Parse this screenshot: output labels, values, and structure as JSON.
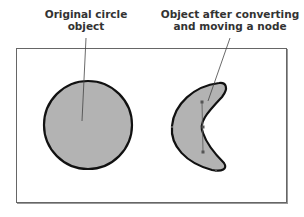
{
  "labels": {
    "original": {
      "line1": "Original circle",
      "line2": "object"
    },
    "modified": {
      "line1": "Object after converting",
      "line2": "and moving a node"
    }
  },
  "colors": {
    "fill": "#b3b3b3",
    "outline": "#111111",
    "frame": "#666666",
    "leader": "#444444",
    "text": "#333333"
  },
  "shapes": {
    "frame": {
      "x": 16,
      "y": 48,
      "width": 271,
      "height": 155
    },
    "circle": {
      "cx": 88,
      "cy": 125,
      "r": 44
    },
    "crescent": {
      "top_tip": [
        222,
        84
      ],
      "bottom_tip": [
        222,
        169
      ],
      "outer_left": [
        172,
        128
      ],
      "inner_node": [
        203,
        127
      ]
    }
  }
}
